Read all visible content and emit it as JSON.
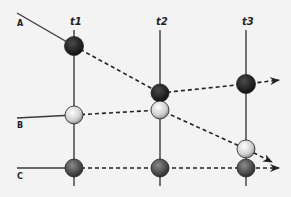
{
  "diagram": {
    "time_labels": [
      "t1",
      "t2",
      "t3"
    ],
    "entity_labels": [
      "A",
      "B",
      "C"
    ],
    "colors": {
      "background": "#f3f3f3",
      "line": "#3a3a3a",
      "dark_node": "#1e1e1e",
      "light_node": "#d8d8d8",
      "medium_node": "#555555"
    },
    "nodes": [
      {
        "entity": "A",
        "time": "t1",
        "shade": "dark"
      },
      {
        "entity": "B",
        "time": "t1",
        "shade": "light"
      },
      {
        "entity": "C",
        "time": "t1",
        "shade": "medium"
      },
      {
        "entity": "A",
        "time": "t2",
        "shade": "dark"
      },
      {
        "entity": "B",
        "time": "t2",
        "shade": "light"
      },
      {
        "entity": "C",
        "time": "t2",
        "shade": "medium"
      },
      {
        "entity": "A",
        "time": "t3",
        "shade": "dark"
      },
      {
        "entity": "B",
        "time": "t3",
        "shade": "light"
      },
      {
        "entity": "C",
        "time": "t3",
        "shade": "medium"
      }
    ],
    "trajectories": [
      {
        "entity": "A",
        "path": [
          "t1",
          "t2",
          "t3"
        ],
        "style": "dashed-arrow"
      },
      {
        "entity": "B",
        "path": [
          "t1",
          "t2",
          "t3"
        ],
        "style": "dashed-arrow"
      },
      {
        "entity": "C",
        "path": [
          "t1",
          "t2",
          "t3"
        ],
        "style": "dashed-arrow"
      }
    ]
  }
}
